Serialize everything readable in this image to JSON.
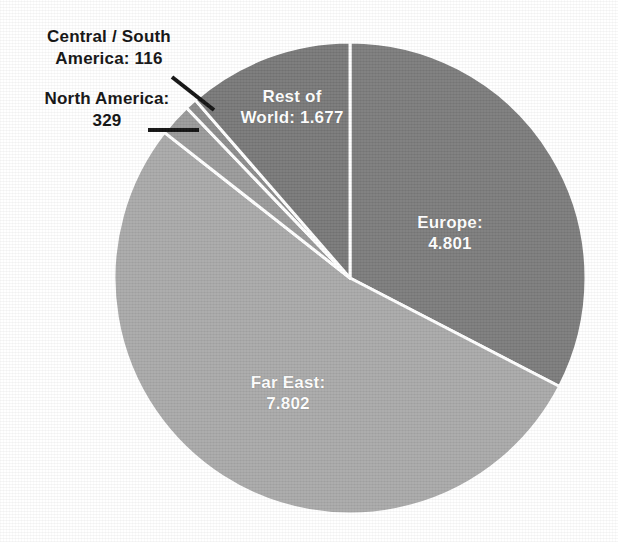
{
  "chart_data": {
    "type": "pie",
    "title": "",
    "subtitle": "",
    "xlabel": "",
    "ylabel": "",
    "legend_position": "none",
    "grid": false,
    "total": 14725,
    "start_angle_deg": 0,
    "direction": "clockwise",
    "categories": [
      "Europe",
      "Far East",
      "North America",
      "Central / South America",
      "Rest of World"
    ],
    "values": [
      4801,
      7802,
      329,
      116,
      1677
    ],
    "value_labels": [
      "4.801",
      "7.802",
      "329",
      "116",
      "1.677"
    ],
    "slices": [
      {
        "name": "Europe",
        "label_line1": "Europe:",
        "label_line2": "4.801",
        "value": 4801,
        "value_text": "4.801",
        "color": "#7c7c7c",
        "label_style": "inside-white",
        "start_deg": 0,
        "end_deg": 117.4
      },
      {
        "name": "Far East",
        "label_line1": "Far East:",
        "label_line2": "7.802",
        "value": 7802,
        "value_text": "7.802",
        "color": "#a9a9a9",
        "label_style": "inside-white",
        "start_deg": 117.4,
        "end_deg": 308.1
      },
      {
        "name": "North America",
        "label_line1": "North America:",
        "label_line2": "329",
        "value": 329,
        "value_text": "329",
        "color": "#9a9a9a",
        "label_style": "callout-black",
        "start_deg": 308.1,
        "end_deg": 316.2
      },
      {
        "name": "Central / South America",
        "label_line1": "Central / South",
        "label_line2": "America: 116",
        "value": 116,
        "value_text": "116",
        "color": "#8c8c8c",
        "label_style": "callout-black",
        "start_deg": 316.2,
        "end_deg": 319.0
      },
      {
        "name": "Rest of World",
        "label_line1": "Rest of",
        "label_line2": "World: 1.677",
        "value": 1677,
        "value_text": "1.677",
        "color": "#787878",
        "label_style": "inside-white",
        "start_deg": 319.0,
        "end_deg": 360.0
      }
    ],
    "separator_color": "#ffffff",
    "background_color": "#ffffff",
    "leader_line_color": "#111111"
  },
  "labels": {
    "europe": {
      "line1": "Europe:",
      "line2": "4.801"
    },
    "far_east": {
      "line1": "Far East:",
      "line2": "7.802"
    },
    "rest_of_world": {
      "line1": "Rest of",
      "line2": "World: 1.677"
    },
    "central_south_america": {
      "line1": "Central / South",
      "line2": "America: 116"
    },
    "north_america": {
      "line1": "North America:",
      "line2": "329"
    }
  },
  "geometry": {
    "center_x": 350,
    "center_y": 278,
    "radius": 236
  }
}
